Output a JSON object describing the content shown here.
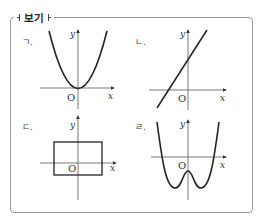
{
  "header": {
    "title": "보기"
  },
  "panels": [
    {
      "id": "a",
      "label": "ㄱ.",
      "shape": "parabola",
      "description": "y = x^2, vertex at origin"
    },
    {
      "id": "b",
      "label": "ㄴ.",
      "shape": "line",
      "description": "increasing line with positive y-intercept"
    },
    {
      "id": "c",
      "label": "ㄷ.",
      "shape": "rectangle",
      "description": "rectangle containing the origin"
    },
    {
      "id": "d",
      "label": "ㄹ.",
      "shape": "quartic",
      "description": "W-shaped curve with two minima and a local maximum below origin"
    }
  ],
  "axes": {
    "x_label": "x",
    "y_label": "y",
    "origin_label": "O"
  },
  "colors": {
    "curve": "#222222",
    "axis": "#555555",
    "frame": "#9a9a9a"
  }
}
